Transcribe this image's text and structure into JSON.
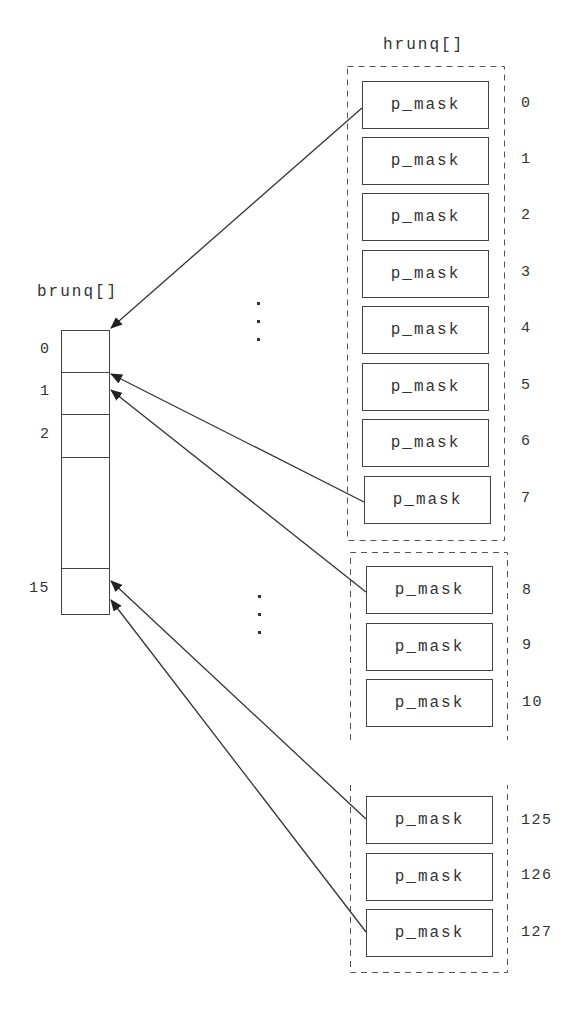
{
  "brunq": {
    "title": "brunq[]",
    "cells": [
      {
        "index": "0",
        "top": 330,
        "height": 42
      },
      {
        "index": "1",
        "top": 372,
        "height": 42
      },
      {
        "index": "2",
        "top": 414,
        "height": 43
      },
      {
        "index": "",
        "top": 457,
        "height": 111
      },
      {
        "index": "15",
        "top": 568,
        "height": 46
      }
    ]
  },
  "hrunq": {
    "title": "hrunq[]",
    "groups": [
      {
        "entries": [
          {
            "label": "p_mask",
            "index": "0"
          },
          {
            "label": "p_mask",
            "index": "1"
          },
          {
            "label": "p_mask",
            "index": "2"
          },
          {
            "label": "p_mask",
            "index": "3"
          },
          {
            "label": "p_mask",
            "index": "4"
          },
          {
            "label": "p_mask",
            "index": "5"
          },
          {
            "label": "p_mask",
            "index": "6"
          },
          {
            "label": "p_mask",
            "index": "7"
          }
        ]
      },
      {
        "entries": [
          {
            "label": "p_mask",
            "index": "8"
          },
          {
            "label": "p_mask",
            "index": "9"
          },
          {
            "label": "p_mask",
            "index": "10"
          }
        ]
      },
      {
        "entries": [
          {
            "label": "p_mask",
            "index": "125"
          },
          {
            "label": "p_mask",
            "index": "126"
          },
          {
            "label": "p_mask",
            "index": "127"
          }
        ]
      }
    ]
  },
  "ellipsis": "⋮",
  "arrows": [
    {
      "from": "hrunq[0]",
      "to": "brunq[0]"
    },
    {
      "from": "hrunq[7]",
      "to": "brunq[1]"
    },
    {
      "from": "hrunq[8]",
      "to": "brunq[1]"
    },
    {
      "from": "hrunq[125]",
      "to": "brunq[15]"
    },
    {
      "from": "hrunq[127]",
      "to": "brunq[15]"
    }
  ],
  "colors": {
    "line": "#444444",
    "text": "#333333",
    "background": "#ffffff"
  }
}
